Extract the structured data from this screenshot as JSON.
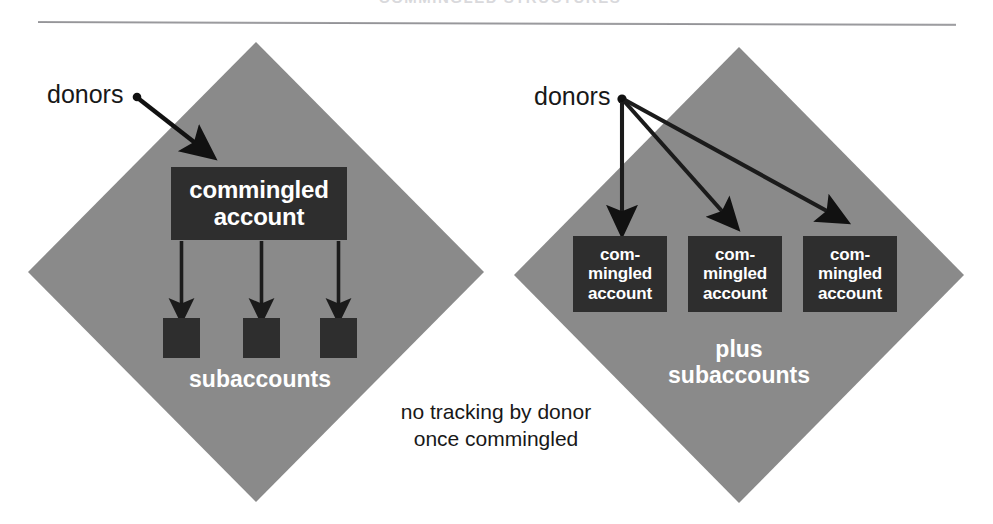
{
  "page": {
    "width": 993,
    "height": 524,
    "background": "#ffffff",
    "cut_off_title": "COMMINGLED STRUCTURES",
    "colors": {
      "diamond_gray": "#8a8a8a",
      "dark_box": "#2e2e2e",
      "label_white": "#ffffff",
      "label_black": "#181818",
      "rule_gray": "#9a9a9e"
    }
  },
  "diagrams": {
    "left": {
      "name": "single commingled account",
      "donors_label": "donors",
      "main_box": {
        "line1": "commingled",
        "line2": "account"
      },
      "subaccounts_label": "subaccounts",
      "subaccount_count": 3,
      "arrow_count_from_donors": 1,
      "arrow_count_to_subaccounts": 3
    },
    "right": {
      "name": "multiple commingled accounts",
      "donors_label": "donors",
      "boxes": [
        {
          "line1": "com-",
          "line2": "mingled",
          "line3": "account"
        },
        {
          "line1": "com-",
          "line2": "mingled",
          "line3": "account"
        },
        {
          "line1": "com-",
          "line2": "mingled",
          "line3": "account"
        }
      ],
      "plus_label": "plus",
      "subaccounts_label": "subaccounts",
      "arrow_count_from_donors": 3
    }
  },
  "caption": {
    "line1": "no tracking by donor",
    "line2": "once commingled"
  }
}
